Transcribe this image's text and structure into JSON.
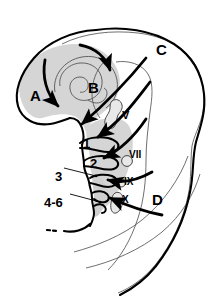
{
  "figure": {
    "background_color": "#ffffff",
    "shade_color": "#d5d5d5",
    "line_color": "#000000",
    "thin_line_color": "#3a3a3a"
  },
  "region_labels": [
    {
      "id": "A",
      "text": "A",
      "x": 30,
      "y": 88,
      "size": "big",
      "meaning": "forebrain-region-label"
    },
    {
      "id": "B",
      "text": "B",
      "x": 88,
      "y": 80,
      "size": "big",
      "meaning": "midbrain-region-label"
    },
    {
      "id": "C",
      "text": "C",
      "x": 156,
      "y": 42,
      "size": "big",
      "meaning": "dorsal-region-label"
    },
    {
      "id": "D",
      "text": "D",
      "x": 152,
      "y": 192,
      "size": "big",
      "meaning": "caudal-region-label"
    }
  ],
  "arch_labels": [
    {
      "id": "1",
      "text": "1",
      "x": 83,
      "y": 137,
      "size": "num",
      "meaning": "pharyngeal-arch-1"
    },
    {
      "id": "2",
      "text": "2",
      "x": 90,
      "y": 157,
      "size": "num",
      "meaning": "pharyngeal-arch-2"
    },
    {
      "id": "3",
      "text": "3",
      "x": 55,
      "y": 170,
      "size": "num",
      "meaning": "pharyngeal-arch-3"
    },
    {
      "id": "4-6",
      "text": "4-6",
      "x": 44,
      "y": 196,
      "size": "num",
      "meaning": "pharyngeal-arch-4-6"
    }
  ],
  "nerve_labels": [
    {
      "id": "V",
      "text": "V",
      "x": 122,
      "y": 110,
      "size": "sm",
      "meaning": "trigeminal-nerve-label"
    },
    {
      "id": "VII",
      "text": "VII",
      "x": 129,
      "y": 150,
      "size": "rom",
      "meaning": "facial-nerve-label"
    },
    {
      "id": "IX",
      "text": "IX",
      "x": 124,
      "y": 177,
      "size": "rom",
      "meaning": "glossopharyngeal-nerve-label"
    },
    {
      "id": "X",
      "text": "X",
      "x": 122,
      "y": 195,
      "size": "rom",
      "meaning": "vagus-nerve-label"
    }
  ],
  "leader_lines": [
    {
      "name": "leader-3",
      "from": [
        64,
        168
      ],
      "to": [
        96,
        176
      ]
    },
    {
      "name": "leader-4-6",
      "from": [
        70,
        194
      ],
      "to": [
        100,
        202
      ]
    }
  ],
  "flow_arrows": [
    {
      "name": "arrow-A-descending",
      "direction": "down-right"
    },
    {
      "name": "arrow-B-curving",
      "direction": "clockwise-down"
    },
    {
      "name": "arrow-C-to-arch1",
      "direction": "down-left"
    },
    {
      "name": "arrow-to-arch1",
      "direction": "left"
    },
    {
      "name": "arrow-to-arch2",
      "direction": "left"
    },
    {
      "name": "arrow-to-arch3",
      "direction": "left"
    },
    {
      "name": "arrow-to-arch4-6",
      "direction": "left"
    }
  ]
}
